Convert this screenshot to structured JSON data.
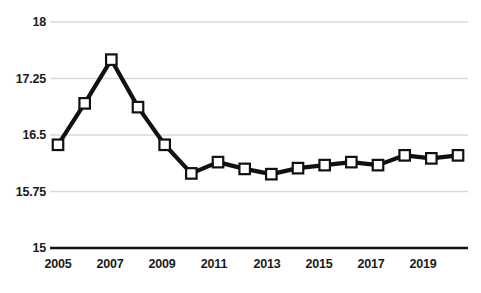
{
  "chart_data": {
    "type": "line",
    "title": "",
    "xlabel": "",
    "ylabel": "",
    "categories": [
      2005,
      2006,
      2007,
      2008,
      2009,
      2010,
      2011,
      2012,
      2013,
      2014,
      2015,
      2016,
      2017,
      2018,
      2019,
      2020
    ],
    "values": [
      16.37,
      16.92,
      17.5,
      16.87,
      16.37,
      15.99,
      16.14,
      16.05,
      15.98,
      16.06,
      16.1,
      16.14,
      16.1,
      16.23,
      16.19,
      16.23
    ],
    "series": [
      {
        "name": "series-1",
        "values": [
          16.37,
          16.92,
          17.5,
          16.87,
          16.37,
          15.99,
          16.14,
          16.05,
          15.98,
          16.06,
          16.1,
          16.14,
          16.1,
          16.23,
          16.19,
          16.23
        ]
      }
    ],
    "ylim": [
      15,
      18
    ],
    "yticks": [
      15,
      15.75,
      16.5,
      17.25,
      18
    ],
    "ytick_labels": [
      "15",
      "15.75",
      "16.5",
      "17.25",
      "18"
    ],
    "xticks": [
      2005,
      2007,
      2009,
      2011,
      2013,
      2015,
      2017,
      2019
    ],
    "xtick_labels": [
      "2005",
      "2007",
      "2009",
      "2011",
      "2013",
      "2015",
      "2017",
      "2019"
    ],
    "grid": true,
    "grid_axis": "y",
    "legend": false,
    "legend_position": "none",
    "marker": "square",
    "marker_facecolor": "#ffffff",
    "line_color": "#111111",
    "grid_color": "#d9d9d9",
    "axis_color": "#111111",
    "background_color": "#ffffff"
  },
  "colors": {
    "line": "#111111",
    "marker_fill": "#ffffff",
    "marker_edge": "#111111",
    "grid": "#d9d9d9",
    "axis": "#111111",
    "text": "#1a1a1a",
    "background": "#ffffff"
  },
  "axes": {
    "y_labels": [
      "18",
      "17.25",
      "16.5",
      "15.75",
      "15"
    ],
    "x_labels": [
      "2005",
      "2007",
      "2009",
      "2011",
      "2013",
      "2015",
      "2017",
      "2019"
    ]
  },
  "header": {
    "clipped_title": ""
  }
}
